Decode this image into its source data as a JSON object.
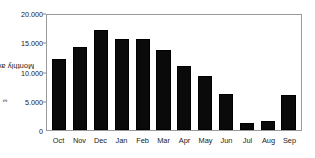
{
  "chart_data": {
    "type": "bar",
    "title": "",
    "subtitle": "",
    "xlabel": "",
    "ylabel": "Monthly average (hm",
    "ylabel_sup": "3",
    "ylabel_suffix": ")",
    "ylabel_full": "Monthly average (hm3)",
    "categories": [
      "Oct",
      "Nov",
      "Dec",
      "Jan",
      "Feb",
      "Mar",
      "Apr",
      "May",
      "Jun",
      "Jul",
      "Aug",
      "Sep"
    ],
    "values": [
      12400,
      14400,
      17400,
      15900,
      15900,
      13900,
      11200,
      9400,
      6200,
      1300,
      1500,
      6100
    ],
    "series": [
      {
        "name": "Monthly average",
        "values": [
          12400,
          14400,
          17400,
          15900,
          15900,
          13900,
          11200,
          9400,
          6200,
          1300,
          1500,
          6100
        ]
      }
    ],
    "ylim": [
      0,
      20000
    ],
    "yticks": [
      0,
      5000,
      10000,
      15000,
      20000
    ],
    "ytick_labels": [
      "0",
      "5.000",
      "10.000",
      "15.000",
      "20.000"
    ],
    "grid": false,
    "legend": false,
    "legend_position": "none",
    "bar_color": "#0a0a0a",
    "frame_color": "#9a9a9a",
    "background": "#ffffff",
    "units": "hm3",
    "number_format": "period-thousands-separator"
  }
}
